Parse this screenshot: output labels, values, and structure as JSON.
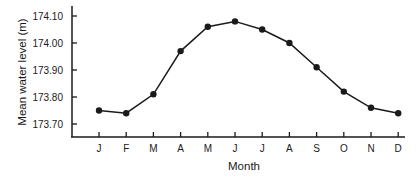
{
  "chart_data": {
    "type": "line",
    "title": "",
    "xlabel": "Month",
    "ylabel": "Mean water level (m)",
    "categories": [
      "J",
      "F",
      "M",
      "A",
      "M",
      "J",
      "J",
      "A",
      "S",
      "O",
      "N",
      "D"
    ],
    "series": [
      {
        "name": "Mean water level",
        "values": [
          173.75,
          173.74,
          173.81,
          173.97,
          174.06,
          174.08,
          174.05,
          174.0,
          173.91,
          173.82,
          173.76,
          173.74
        ]
      }
    ],
    "yticks": [
      173.7,
      173.8,
      173.9,
      174.0,
      174.1
    ],
    "ytick_labels": [
      "173.70",
      "173.80",
      "173.90",
      "174.00",
      "174.10"
    ],
    "ylim": [
      173.6,
      174.14
    ],
    "grid": false,
    "legend": "none",
    "marker": "filled-circle",
    "colors": {
      "line": "#1a1a1a",
      "marker": "#1a1a1a",
      "axis": "#1a1a1a"
    }
  }
}
